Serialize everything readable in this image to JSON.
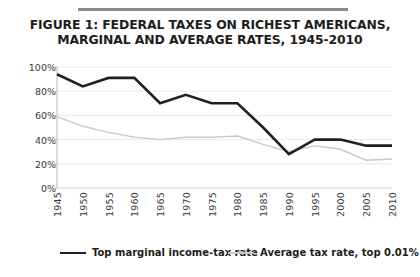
{
  "figure": {
    "title_line1": "FIGURE 1: FEDERAL TAXES ON RICHEST AMERICANS,",
    "title_line2": "MARGINAL AND AVERAGE RATES, 1945-2010"
  },
  "legend": {
    "items": [
      {
        "label": "Top marginal income-tax rate",
        "color": "#231f20",
        "style": "thick"
      },
      {
        "label": "Average tax rate, top 0.01%",
        "color": "#c9c9c9",
        "style": "thin"
      }
    ]
  },
  "chart_data": {
    "type": "line",
    "title": "FIGURE 1: FEDERAL TAXES ON RICHEST AMERICANS, MARGINAL AND AVERAGE RATES, 1945-2010",
    "xlabel": "",
    "ylabel": "",
    "x": [
      1945,
      1950,
      1955,
      1960,
      1965,
      1970,
      1975,
      1980,
      1985,
      1990,
      1995,
      2000,
      2005,
      2010
    ],
    "categories": [
      "1945",
      "1950",
      "1955",
      "1960",
      "1965",
      "1970",
      "1975",
      "1980",
      "1985",
      "1990",
      "1995",
      "2000",
      "2005",
      "2010"
    ],
    "xlim": [
      1945,
      2010
    ],
    "ylim": [
      0,
      100
    ],
    "yticks": [
      0,
      20,
      40,
      60,
      80,
      100
    ],
    "ytick_labels": [
      "0%",
      "20%",
      "40%",
      "60%",
      "80%",
      "100%"
    ],
    "grid": true,
    "legend_position": "bottom",
    "series": [
      {
        "name": "Top marginal income-tax rate",
        "color": "#231f20",
        "width": 2.6,
        "values": [
          94,
          84,
          91,
          91,
          70,
          77,
          70,
          70,
          50,
          28,
          40,
          40,
          35,
          35
        ]
      },
      {
        "name": "Average tax rate, top 0.01%",
        "color": "#c9c9c9",
        "width": 1.4,
        "values": [
          59,
          51,
          46,
          42,
          40,
          42,
          42,
          43,
          36,
          30,
          35,
          32,
          23,
          24
        ]
      }
    ]
  }
}
